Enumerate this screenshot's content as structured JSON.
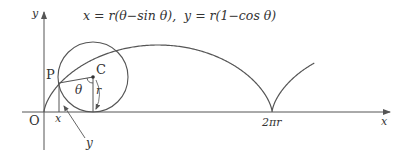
{
  "diagram": {
    "title_equation": "x = r(θ−sin θ),  y = r(1−cos θ)",
    "equation_x": "x = r(θ−sin θ),",
    "equation_y": "y = r(1−cos θ)",
    "labels": {
      "axis_x": "x",
      "axis_y": "y",
      "origin": "O",
      "point_p": "P",
      "center_c": "C",
      "angle": "θ",
      "radius": "r",
      "coord_x": "x",
      "coord_y": "y",
      "cusp": "2πr"
    },
    "colors": {
      "stroke": "#555555",
      "text": "#333333"
    }
  }
}
